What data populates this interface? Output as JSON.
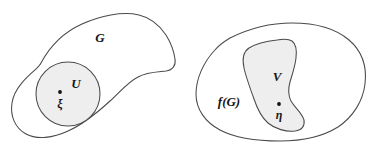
{
  "figure": {
    "kind": "set-diagram",
    "colors": {
      "background": "#ffffff",
      "outline": "#4a4a4a",
      "subregion_fill": "#eeeeee",
      "point": "#111111",
      "label": "#161616"
    }
  },
  "left_region": {
    "outer_label": "G",
    "inner_label": "U",
    "point_label": "ξ"
  },
  "right_region": {
    "outer_label": "f(G)",
    "inner_label": "V",
    "point_label": "η"
  }
}
